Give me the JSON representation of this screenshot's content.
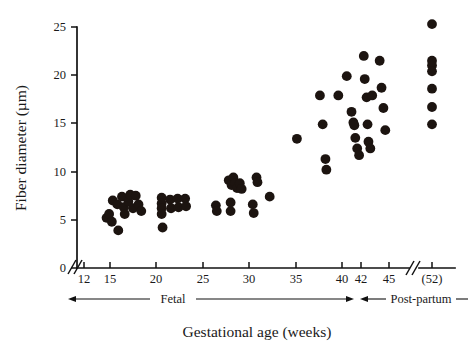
{
  "chart_data": {
    "type": "scatter",
    "title": "",
    "xlabel": "Gestational age (weeks)",
    "ylabel": "Fiber diameter (µm)",
    "xlim": [
      11,
      53
    ],
    "ylim": [
      0,
      25
    ],
    "grid": false,
    "legend": null,
    "x_ticks": [
      {
        "value": 12,
        "label": "12"
      },
      {
        "value": 15,
        "label": "15"
      },
      {
        "value": 20,
        "label": "20"
      },
      {
        "value": 25,
        "label": "25"
      },
      {
        "value": 30,
        "label": "30"
      },
      {
        "value": 35,
        "label": "35"
      },
      {
        "value": 40,
        "label": "40"
      },
      {
        "value": 42,
        "label": "42"
      },
      {
        "value": 45,
        "label": "45"
      },
      {
        "value": 52,
        "label": "(52)"
      }
    ],
    "y_ticks": [
      {
        "value": 0,
        "label": "0"
      },
      {
        "value": 5,
        "label": "5"
      },
      {
        "value": 10,
        "label": "10"
      },
      {
        "value": 15,
        "label": "15"
      },
      {
        "value": 20,
        "label": "20"
      },
      {
        "value": 25,
        "label": "25"
      }
    ],
    "axis_breaks": [
      {
        "axis": "x",
        "position": "origin",
        "symbol": "//"
      },
      {
        "axis": "x",
        "position": "before-52",
        "symbol": "//"
      }
    ],
    "annotations": [
      {
        "name": "fetal-range",
        "label": "Fetal",
        "from": 12,
        "to": 42,
        "arrows": "both"
      },
      {
        "name": "post-partum-range",
        "label": "Post-partum",
        "from": 42,
        "to": 53,
        "arrows": "both"
      }
    ],
    "marker": {
      "shape": "circle",
      "color": "#1c1410",
      "size": 5.6
    },
    "points": [
      {
        "x": 14.6,
        "y": 5.2
      },
      {
        "x": 14.9,
        "y": 5.6
      },
      {
        "x": 15.2,
        "y": 4.8
      },
      {
        "x": 15.3,
        "y": 7.0
      },
      {
        "x": 15.8,
        "y": 6.6
      },
      {
        "x": 15.9,
        "y": 3.9
      },
      {
        "x": 16.3,
        "y": 7.4
      },
      {
        "x": 16.5,
        "y": 6.3
      },
      {
        "x": 16.6,
        "y": 5.6
      },
      {
        "x": 17.0,
        "y": 6.9
      },
      {
        "x": 17.2,
        "y": 7.6
      },
      {
        "x": 17.5,
        "y": 6.2
      },
      {
        "x": 17.8,
        "y": 7.5
      },
      {
        "x": 18.1,
        "y": 6.6
      },
      {
        "x": 18.4,
        "y": 5.9
      },
      {
        "x": 20.6,
        "y": 7.3
      },
      {
        "x": 20.6,
        "y": 6.7
      },
      {
        "x": 20.6,
        "y": 6.2
      },
      {
        "x": 20.6,
        "y": 5.6
      },
      {
        "x": 20.7,
        "y": 4.2
      },
      {
        "x": 21.5,
        "y": 7.1
      },
      {
        "x": 21.6,
        "y": 6.2
      },
      {
        "x": 22.3,
        "y": 7.2
      },
      {
        "x": 22.4,
        "y": 6.3
      },
      {
        "x": 23.1,
        "y": 7.2
      },
      {
        "x": 23.2,
        "y": 6.4
      },
      {
        "x": 26.4,
        "y": 6.5
      },
      {
        "x": 26.5,
        "y": 5.9
      },
      {
        "x": 27.8,
        "y": 9.1
      },
      {
        "x": 28.1,
        "y": 8.6
      },
      {
        "x": 28.3,
        "y": 9.4
      },
      {
        "x": 28.5,
        "y": 8.8
      },
      {
        "x": 28.7,
        "y": 8.3
      },
      {
        "x": 29.0,
        "y": 8.8
      },
      {
        "x": 29.2,
        "y": 8.2
      },
      {
        "x": 28.0,
        "y": 6.8
      },
      {
        "x": 28.0,
        "y": 5.9
      },
      {
        "x": 30.8,
        "y": 9.4
      },
      {
        "x": 30.9,
        "y": 8.9
      },
      {
        "x": 30.4,
        "y": 6.6
      },
      {
        "x": 30.5,
        "y": 5.7
      },
      {
        "x": 32.2,
        "y": 7.4
      },
      {
        "x": 35.1,
        "y": 13.4
      },
      {
        "x": 37.6,
        "y": 17.9
      },
      {
        "x": 37.9,
        "y": 14.9
      },
      {
        "x": 38.2,
        "y": 11.3
      },
      {
        "x": 38.3,
        "y": 10.2
      },
      {
        "x": 39.6,
        "y": 17.9
      },
      {
        "x": 40.5,
        "y": 19.9
      },
      {
        "x": 41.0,
        "y": 16.2
      },
      {
        "x": 41.2,
        "y": 15.1
      },
      {
        "x": 41.3,
        "y": 14.8
      },
      {
        "x": 41.4,
        "y": 13.5
      },
      {
        "x": 41.6,
        "y": 12.4
      },
      {
        "x": 41.8,
        "y": 11.7
      },
      {
        "x": 42.3,
        "y": 22.0
      },
      {
        "x": 42.4,
        "y": 19.6
      },
      {
        "x": 42.6,
        "y": 17.7
      },
      {
        "x": 42.7,
        "y": 14.9
      },
      {
        "x": 42.8,
        "y": 13.1
      },
      {
        "x": 43.0,
        "y": 12.4
      },
      {
        "x": 43.2,
        "y": 17.9
      },
      {
        "x": 44.0,
        "y": 21.5
      },
      {
        "x": 44.2,
        "y": 18.7
      },
      {
        "x": 44.4,
        "y": 16.6
      },
      {
        "x": 44.6,
        "y": 14.3
      },
      {
        "x": 52.0,
        "y": 25.3
      },
      {
        "x": 52.0,
        "y": 21.5
      },
      {
        "x": 52.0,
        "y": 21.0
      },
      {
        "x": 52.0,
        "y": 20.4
      },
      {
        "x": 52.0,
        "y": 18.6
      },
      {
        "x": 52.0,
        "y": 16.7
      },
      {
        "x": 52.0,
        "y": 14.9
      }
    ]
  }
}
